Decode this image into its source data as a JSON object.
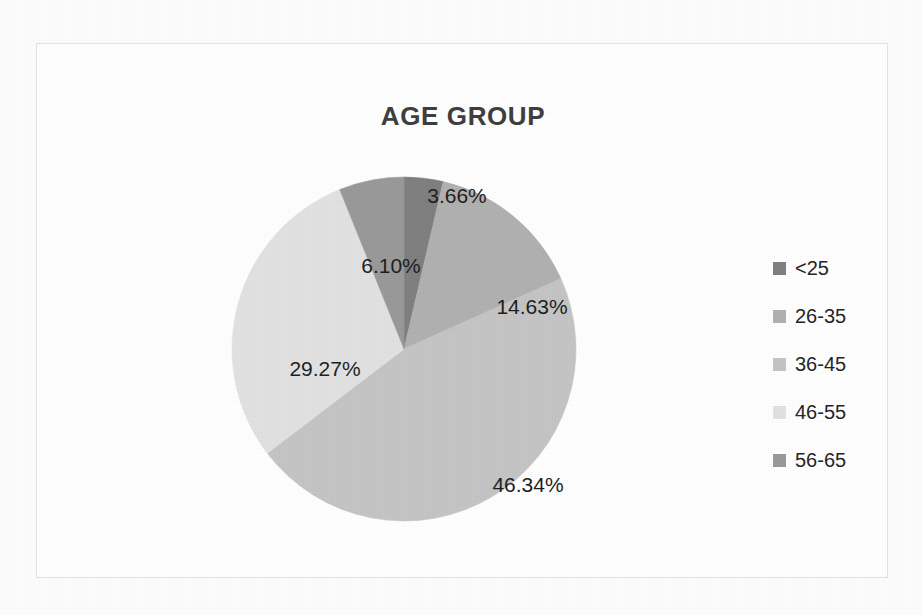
{
  "chart_data": {
    "type": "pie",
    "title": "AGE GROUP",
    "categories": [
      "<25",
      "26-35",
      "36-45",
      "46-55",
      "56-65"
    ],
    "values": [
      3.66,
      14.63,
      46.34,
      29.27,
      6.1
    ],
    "value_unit": "%",
    "data_labels": [
      "3.66%",
      "14.63%",
      "46.34%",
      "29.27%",
      "6.10%"
    ],
    "slice_colors": [
      "#808080",
      "#b1b1b1",
      "#c5c5c5",
      "#e2e2e2",
      "#9a9a9a"
    ],
    "legend_position": "right",
    "start_angle_deg": 0,
    "direction": "clockwise",
    "grid": false,
    "xlabel": "",
    "ylabel": ""
  },
  "frame": {
    "border_color": "#e3e3e3",
    "background": "#ffffff"
  },
  "title": {
    "text": "AGE GROUP",
    "color": "#3f3f3f"
  },
  "labels": [
    {
      "text": "3.66%",
      "x": 226,
      "y": 20
    },
    {
      "text": "14.63%",
      "x": 301,
      "y": 131
    },
    {
      "text": "46.34%",
      "x": 297,
      "y": 309
    },
    {
      "text": "29.27%",
      "x": 94,
      "y": 193
    },
    {
      "text": "6.10%",
      "x": 160,
      "y": 90
    }
  ],
  "legend": {
    "items": [
      {
        "label": "<25",
        "color": "#808080"
      },
      {
        "label": "26-35",
        "color": "#b1b1b1"
      },
      {
        "label": "36-45",
        "color": "#c5c5c5"
      },
      {
        "label": "46-55",
        "color": "#e2e2e2"
      },
      {
        "label": "56-65",
        "color": "#9a9a9a"
      }
    ]
  }
}
